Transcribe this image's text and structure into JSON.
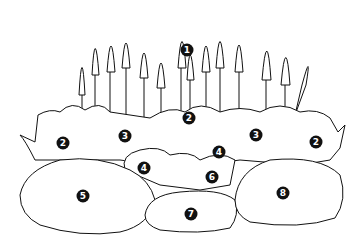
{
  "diagram": {
    "type": "planting-plan-illustration",
    "line_color": "#111111",
    "background": "#ffffff",
    "markers": [
      {
        "label": "1",
        "x": 187,
        "y": 50,
        "plant": "tall spires (back row)"
      },
      {
        "label": "2",
        "x": 189,
        "y": 118,
        "plant": "mid-border perennial"
      },
      {
        "label": "2",
        "x": 63,
        "y": 143
      },
      {
        "label": "2",
        "x": 316,
        "y": 142
      },
      {
        "label": "3",
        "x": 125,
        "y": 136
      },
      {
        "label": "3",
        "x": 256,
        "y": 135
      },
      {
        "label": "4",
        "x": 144,
        "y": 168
      },
      {
        "label": "4",
        "x": 219,
        "y": 152
      },
      {
        "label": "5",
        "x": 83,
        "y": 196
      },
      {
        "label": "6",
        "x": 212,
        "y": 177
      },
      {
        "label": "7",
        "x": 191,
        "y": 214
      },
      {
        "label": "8",
        "x": 283,
        "y": 193
      }
    ]
  }
}
